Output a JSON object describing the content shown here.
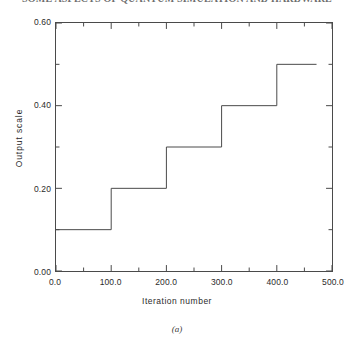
{
  "header": {
    "text": "SOME ASPECTS OF QUANTUM SIMULATION AND HARDWARE"
  },
  "caption": {
    "text": "(a)"
  },
  "axes": {
    "y_tick_labels": [
      "0.60",
      "0.40",
      "0.20",
      "0.00"
    ],
    "y_tick_values": [
      0.6,
      0.4,
      0.2,
      0.0
    ],
    "y_minor_values": [
      0.5,
      0.3,
      0.1
    ],
    "x_tick_labels": [
      "0.0",
      "100.0",
      "200.0",
      "300.0",
      "400.0",
      "500.0"
    ],
    "x_tick_values": [
      0,
      100,
      200,
      300,
      400,
      500
    ],
    "x_minor_values": [
      50,
      150,
      250,
      350,
      450
    ]
  },
  "style": {
    "line_color": "#4a4a4a",
    "frame_color": "#4a4a4a",
    "background": "#ffffff",
    "text_color": "#2b2b2b"
  },
  "chart_data": {
    "type": "line",
    "title": "",
    "subtitle": "",
    "xlabel": "Iteration number",
    "ylabel": "Output scale",
    "xlim": [
      0,
      500
    ],
    "ylim": [
      0,
      0.6
    ],
    "grid": false,
    "legend": null,
    "drawstyle": "steps-post",
    "series": [
      {
        "name": "Output scale",
        "x": [
          0,
          100,
          100,
          200,
          200,
          300,
          300,
          400,
          400,
          472
        ],
        "y": [
          0.1,
          0.1,
          0.2,
          0.2,
          0.3,
          0.3,
          0.4,
          0.4,
          0.5,
          0.5
        ]
      }
    ],
    "steps": [
      {
        "x_start": 0,
        "x_end": 100,
        "value": 0.1
      },
      {
        "x_start": 100,
        "x_end": 200,
        "value": 0.2
      },
      {
        "x_start": 200,
        "x_end": 300,
        "value": 0.3
      },
      {
        "x_start": 300,
        "x_end": 400,
        "value": 0.4
      },
      {
        "x_start": 400,
        "x_end": 472,
        "value": 0.5
      }
    ]
  }
}
